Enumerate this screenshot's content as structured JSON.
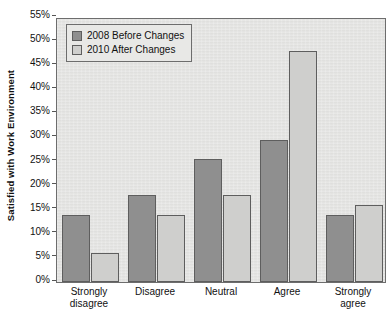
{
  "chart_data": {
    "type": "bar",
    "title": "",
    "xlabel": "",
    "ylabel": "Satisfied with Work Environment",
    "ylim": [
      0,
      55
    ],
    "ytick_step": 5,
    "ytick_labels": [
      "0%",
      "5%",
      "10%",
      "15%",
      "20%",
      "25%",
      "30%",
      "35%",
      "40%",
      "45%",
      "50%",
      "55%"
    ],
    "ytick_values": [
      0,
      5,
      10,
      15,
      20,
      25,
      30,
      35,
      40,
      45,
      50,
      55
    ],
    "grid": false,
    "legend_position": "top-left",
    "categories": [
      "Strongly disagree",
      "Disagree",
      "Neutral",
      "Agree",
      "Strongly agree"
    ],
    "category_lines": [
      [
        "Strongly",
        "disagree"
      ],
      [
        "Disagree",
        ""
      ],
      [
        "Neutral",
        ""
      ],
      [
        "Agree",
        ""
      ],
      [
        "Strongly",
        "agree"
      ]
    ],
    "series": [
      {
        "name": "2008 Before Changes",
        "color": "#8f8f8f",
        "values": [
          14,
          18,
          25.5,
          29.5,
          14
        ]
      },
      {
        "name": "2010 After Changes",
        "color": "#cfcfcd",
        "values": [
          6,
          14,
          18,
          48,
          16
        ]
      }
    ]
  },
  "legend": {
    "entries": [
      {
        "label": "2008 Before Changes"
      },
      {
        "label": "2010 After Changes"
      }
    ]
  }
}
